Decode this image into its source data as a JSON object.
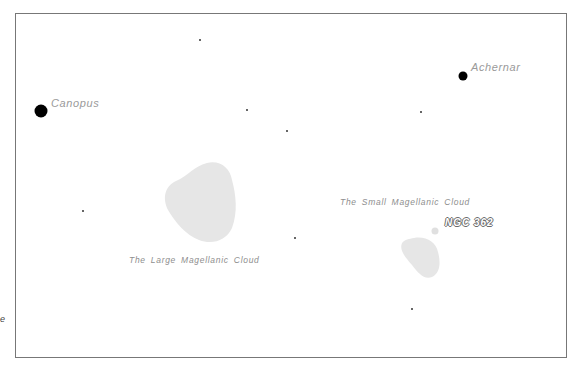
{
  "figure": {
    "frame_color": "#777777",
    "background": "#ffffff",
    "edge_fragment": "e"
  },
  "stars": {
    "bright": [
      {
        "name": "Canopus",
        "x": 41,
        "y": 111,
        "r": 6.5,
        "label_x": 51,
        "label_y": 97
      },
      {
        "name": "Achernar",
        "x": 463,
        "y": 76,
        "r": 4.5,
        "label_x": 471,
        "label_y": 61
      }
    ],
    "faint": [
      {
        "x": 200,
        "y": 40
      },
      {
        "x": 247,
        "y": 110
      },
      {
        "x": 287,
        "y": 131
      },
      {
        "x": 421,
        "y": 112
      },
      {
        "x": 83,
        "y": 211
      },
      {
        "x": 295,
        "y": 238
      },
      {
        "x": 412,
        "y": 309
      }
    ]
  },
  "objects": {
    "lmc": {
      "label": "The Large Magellanic Cloud",
      "label_x": 129,
      "label_y": 255,
      "color": "#e6e6e6"
    },
    "smc": {
      "label": "The Small Magellanic Cloud",
      "label_x": 340,
      "label_y": 197,
      "color": "#e6e6e6"
    },
    "ngc362": {
      "label": "NGC 362",
      "x": 435,
      "y": 231,
      "r": 3.5,
      "label_x": 444,
      "label_y": 218
    }
  }
}
